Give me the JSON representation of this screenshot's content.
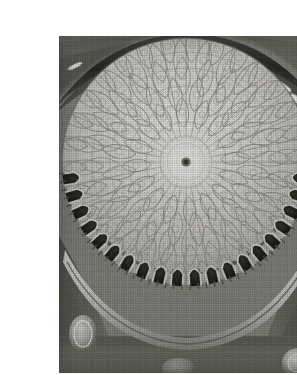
{
  "page": {
    "background_color": "#ffffff",
    "width": 297,
    "height": 375,
    "content_type": "halftone-grayscale-photograph"
  },
  "figure": {
    "frame": {
      "x": 19,
      "y": 20,
      "width": 258,
      "height": 337
    },
    "print_style": "halftone dot screen, monochrome",
    "palette": {
      "paper": "#ffffff",
      "highlight": "#f2f1ef",
      "dome_light": "#e3e2de",
      "dome_mid": "#c8c7c2",
      "stone_mid": "#9a9a95",
      "stone_dark": "#6d6d69",
      "shadow": "#4a4a47",
      "deep_shadow": "#23231f",
      "window_white": "#fbfbf9"
    },
    "geometry": {
      "dome_center_x": 127,
      "dome_center_y": 126,
      "dome_outer_radius": 124,
      "crown_ring_radius": 26,
      "oculus_boss_radius": 4,
      "rib_count": 32,
      "lattice_rings": 5,
      "arcade_arch_count": 20,
      "rim_slit_window_count": 7,
      "pendentive_medallion_count": 3
    },
    "elements": [
      {
        "name": "dome-crown-medallion",
        "note": "small dark central boss at the apex of the dome"
      },
      {
        "name": "crown-ring",
        "note": "bright circular band around the apex"
      },
      {
        "name": "radial-rib-web",
        "note": "ribs radiating from the apex toward the dome base"
      },
      {
        "name": "ogival-lattice",
        "note": "interlaced teardrop / almond shaped ornament panels in concentric rings"
      },
      {
        "name": "inscription-band",
        "note": "dark calligraphic frieze circling the lower dome"
      },
      {
        "name": "arcade",
        "note": "ring of dark pointed-arch window openings at the drum"
      },
      {
        "name": "cornice-band",
        "note": "narrow light moulding below the arcade"
      },
      {
        "name": "pendentive",
        "note": "dark spandrel surfaces in the lower corners"
      },
      {
        "name": "rim-slit-windows",
        "note": "elongated white highlights on the upper dark rim"
      }
    ]
  }
}
